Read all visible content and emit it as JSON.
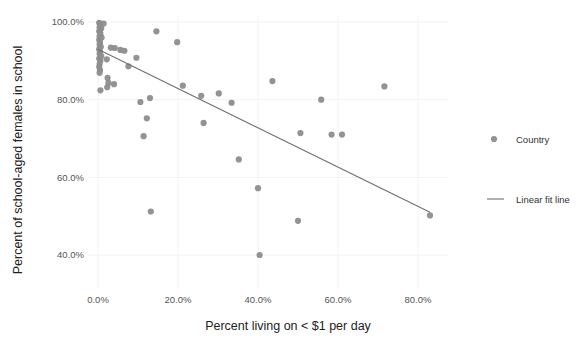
{
  "chart_data": {
    "type": "scatter",
    "title": "",
    "xlabel": "Percent living on < $1 per day",
    "ylabel": "Percent of school-aged females in school",
    "xlim": [
      -3,
      88
    ],
    "ylim": [
      36,
      102
    ],
    "xticks": [
      "0.0%",
      "20.0%",
      "40.0%",
      "60.0%",
      "80.0%"
    ],
    "xtick_values": [
      0,
      20,
      40,
      60,
      80
    ],
    "yticks": [
      "100.0%",
      "80.0%",
      "60.0%",
      "40.0%"
    ],
    "ytick_values": [
      100,
      80,
      60,
      40
    ],
    "grid": true,
    "grid_color": "#f2f2f2",
    "legend_position": "right",
    "marker_color": "#8d8d8d",
    "line_color": "#6f6f6f",
    "series": [
      {
        "name": "Country",
        "type": "scatter",
        "points": [
          [
            0.3,
            99.8
          ],
          [
            0.5,
            99.5
          ],
          [
            1.4,
            99.6
          ],
          [
            0.4,
            98.6
          ],
          [
            0.8,
            98.3
          ],
          [
            0.3,
            97.6
          ],
          [
            0.6,
            97.0
          ],
          [
            0.4,
            96.3
          ],
          [
            0.9,
            96.0
          ],
          [
            0.3,
            95.4
          ],
          [
            0.5,
            94.8
          ],
          [
            0.4,
            94.2
          ],
          [
            0.7,
            93.6
          ],
          [
            0.3,
            93.0
          ],
          [
            0.5,
            92.4
          ],
          [
            0.4,
            91.8
          ],
          [
            0.8,
            91.2
          ],
          [
            0.3,
            90.6
          ],
          [
            0.6,
            90.0
          ],
          [
            0.4,
            89.2
          ],
          [
            0.3,
            88.4
          ],
          [
            0.5,
            87.6
          ],
          [
            0.4,
            86.9
          ],
          [
            3.2,
            93.4
          ],
          [
            4.2,
            93.3
          ],
          [
            5.6,
            92.8
          ],
          [
            6.6,
            92.6
          ],
          [
            2.2,
            90.4
          ],
          [
            2.4,
            85.6
          ],
          [
            2.6,
            84.3
          ],
          [
            2.3,
            83.2
          ],
          [
            4.0,
            84.0
          ],
          [
            0.6,
            82.4
          ],
          [
            9.6,
            90.8
          ],
          [
            7.6,
            88.6
          ],
          [
            14.6,
            97.6
          ],
          [
            19.8,
            94.8
          ],
          [
            13.0,
            80.4
          ],
          [
            12.2,
            75.2
          ],
          [
            10.6,
            79.4
          ],
          [
            11.4,
            70.6
          ],
          [
            13.2,
            51.2
          ],
          [
            21.2,
            83.6
          ],
          [
            25.8,
            81.0
          ],
          [
            26.4,
            74.0
          ],
          [
            30.2,
            81.6
          ],
          [
            33.4,
            79.2
          ],
          [
            35.2,
            64.6
          ],
          [
            40.0,
            57.2
          ],
          [
            40.4,
            40.0
          ],
          [
            43.6,
            84.8
          ],
          [
            50.6,
            71.4
          ],
          [
            50.0,
            48.8
          ],
          [
            55.8,
            80.0
          ],
          [
            58.4,
            71.0
          ],
          [
            61.0,
            71.0
          ],
          [
            71.6,
            83.4
          ],
          [
            83.0,
            50.2
          ]
        ]
      },
      {
        "name": "Linear fit line",
        "type": "line",
        "points": [
          [
            0,
            93.0
          ],
          [
            83.0,
            51.0
          ]
        ]
      }
    ]
  },
  "legend": {
    "items": [
      {
        "label": "Country",
        "marker": "dot"
      },
      {
        "label": "Linear fit line",
        "marker": "line"
      }
    ]
  }
}
